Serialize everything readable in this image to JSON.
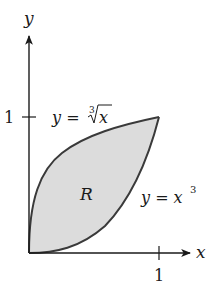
{
  "figure": {
    "type": "region-between-curves",
    "colors": {
      "axis": "#1a1a1a",
      "curve": "#3a3a3a",
      "fill": "#dcdcdc",
      "background": "#ffffff"
    },
    "axes": {
      "x_label": "x",
      "y_label": "y",
      "x_tick_label": "1",
      "y_tick_label": "1"
    },
    "curves": [
      {
        "name": "cube-root",
        "label_lhs": "y = ",
        "label_root_index": "3",
        "label_radicand": "x"
      },
      {
        "name": "cubic",
        "label_lhs": "y = x",
        "label_exponent": "3"
      }
    ],
    "region_label": "R"
  }
}
